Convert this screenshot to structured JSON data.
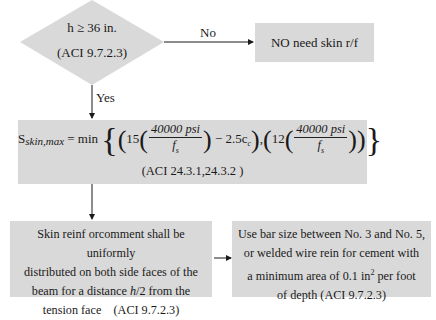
{
  "decision": {
    "condition": "h ≥ 36 in.",
    "reference": "(ACI 9.7.2.3)",
    "no_label": "No",
    "yes_label": "Yes"
  },
  "no_result": {
    "text": "NO need skin r/f"
  },
  "formula_box": {
    "lhs_main": "S",
    "lhs_sub": "skin,max",
    "equals": " = min ",
    "term1_coef": "15",
    "numerator": "40000 psi",
    "denominator": "f",
    "denominator_sub": "s",
    "minus_term": " − 2.5c",
    "minus_term_sub": "c",
    "term2_coef": "12",
    "reference": "(ACI  24.3.1,24.3.2 )"
  },
  "distribution_box": {
    "line1": "Skin reinf orcomment shall be uniformly",
    "line2": "distributed on both side faces of the",
    "line3_pre": "beam for a distance ",
    "line3_var": "h",
    "line3_post": "/2 from the",
    "line4": "tension face    (ACI 9.7.2.3)"
  },
  "bar_size_box": {
    "line1": "Use bar size between No. 3 and No. 5,",
    "line2": "or welded wire rein for cement with",
    "line3_pre": "a minimum area of 0.1 in",
    "line3_sup": "2",
    "line3_post": " per foot",
    "line4": "of depth (ACI 9.7.2.3)"
  },
  "colors": {
    "box_fill": "#d9d9d9",
    "line": "#1a1a1a",
    "background": "#ffffff"
  }
}
